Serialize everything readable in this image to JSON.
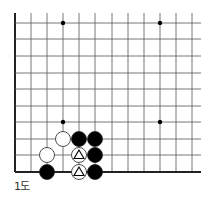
{
  "diagram": {
    "caption": "1도",
    "colors": {
      "line": "#555555",
      "edge": "#222222",
      "black_stone": "#000000",
      "white_stone": "#ffffff",
      "stone_stroke": "#222222"
    },
    "grid": {
      "columns_x": [
        15,
        31,
        47,
        63,
        79,
        95,
        112,
        128,
        144,
        160,
        176,
        192
      ],
      "rows_y": [
        23,
        39,
        56,
        73,
        89,
        106,
        122,
        139,
        155,
        172
      ],
      "line_top": 13,
      "line_right": 201,
      "left_edge_x": 15,
      "bottom_edge_y": 172
    },
    "star_points": [
      {
        "x": 63,
        "y": 23
      },
      {
        "x": 160,
        "y": 23
      },
      {
        "x": 63,
        "y": 122
      },
      {
        "x": 160,
        "y": 122
      }
    ],
    "stones": [
      {
        "color": "black",
        "x": 47,
        "y": 172,
        "marker": null
      },
      {
        "color": "white",
        "x": 47,
        "y": 155,
        "marker": null
      },
      {
        "color": "white",
        "x": 63,
        "y": 139,
        "marker": null
      },
      {
        "color": "black",
        "x": 79,
        "y": 139,
        "marker": null
      },
      {
        "color": "black",
        "x": 95,
        "y": 139,
        "marker": null
      },
      {
        "color": "white",
        "x": 79,
        "y": 155,
        "marker": "triangle"
      },
      {
        "color": "black",
        "x": 95,
        "y": 155,
        "marker": null
      },
      {
        "color": "white",
        "x": 79,
        "y": 172,
        "marker": "triangle"
      },
      {
        "color": "black",
        "x": 95,
        "y": 172,
        "marker": null
      }
    ]
  }
}
